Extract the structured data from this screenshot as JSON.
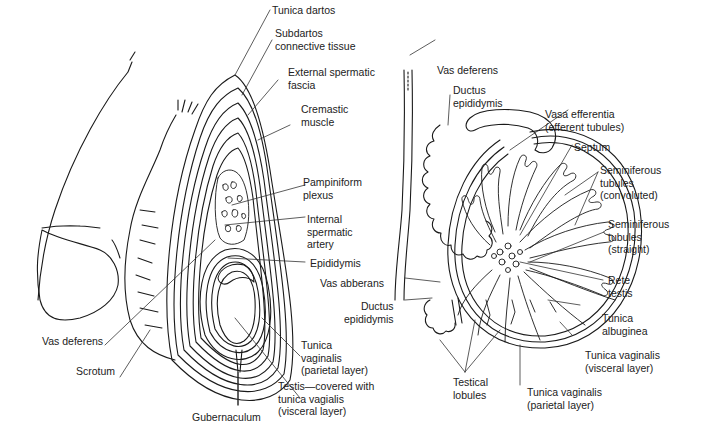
{
  "diagram": {
    "type": "anatomical-illustration",
    "colors": {
      "line": "#1a1a1a",
      "text": "#222222",
      "leader": "#333333",
      "background": "#ffffff"
    },
    "left_figure": {
      "name": "Scrotal layers (frontal section)",
      "labels": [
        {
          "id": "tunica-dartos",
          "text": "Tunica dartos"
        },
        {
          "id": "subdartos",
          "text": "Subdartos\nconnective tissue"
        },
        {
          "id": "ext-spermatic-fascia",
          "text": "External spermatic\nfascia"
        },
        {
          "id": "cremastic-muscle",
          "text": "Cremastic\nmuscle"
        },
        {
          "id": "pampiniform-plexus",
          "text": "Pampiniform\nplexus"
        },
        {
          "id": "internal-spermatic-artery",
          "text": "Internal\nspermatic\nartery"
        },
        {
          "id": "epididymis",
          "text": "Epididymis"
        },
        {
          "id": "tunica-vaginalis-parietal-left",
          "text": "Tunica\nvaginalis\n(parietal layer)"
        },
        {
          "id": "testis-covered",
          "text": "Testis—covered with\ntunica vagialis\n(visceral layer)"
        },
        {
          "id": "gubernaculum",
          "text": "Gubernaculum"
        },
        {
          "id": "scrotum",
          "text": "Scrotum"
        },
        {
          "id": "vas-deferens-left",
          "text": "Vas deferens"
        }
      ]
    },
    "right_figure": {
      "name": "Testis and epididymis (sagittal section)",
      "labels": [
        {
          "id": "vas-deferens-right",
          "text": "Vas deferens"
        },
        {
          "id": "ductus-epididymis-top",
          "text": "Ductus\nepididymis"
        },
        {
          "id": "vasa-efferentia",
          "text": "Vasa efferentia\n(efferent tubules)"
        },
        {
          "id": "septum",
          "text": "Septum"
        },
        {
          "id": "seminiferous-convoluted",
          "text": "Seminiferous\ntubules\n(convoluted)"
        },
        {
          "id": "seminiferous-straight",
          "text": "Seminiferous\ntubules\n(straight)"
        },
        {
          "id": "rete-testis",
          "text": "Rete\ntestis"
        },
        {
          "id": "tunica-albuginea",
          "text": "Tunica\nalbuginea"
        },
        {
          "id": "tunica-vaginalis-visceral",
          "text": "Tunica vaginalis\n(visceral layer)"
        },
        {
          "id": "tunica-vaginalis-parietal-right",
          "text": "Tunica vaginalis\n(parietal layer)"
        },
        {
          "id": "testical-lobules",
          "text": "Testical\nlobules"
        },
        {
          "id": "vas-abberans",
          "text": "Vas abberans"
        },
        {
          "id": "ductus-epididymis-bottom",
          "text": "Ductus\nepididymis"
        }
      ]
    }
  }
}
